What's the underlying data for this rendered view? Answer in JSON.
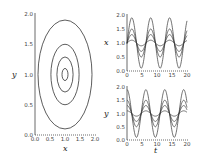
{
  "chart_data": [
    {
      "type": "line",
      "title": "",
      "xlabel": "x",
      "ylabel": "y",
      "xlim": [
        0,
        2
      ],
      "ylim": [
        0,
        2
      ],
      "xticks": [
        "0.0",
        "0.5",
        "1.0",
        "1.5",
        "2.0"
      ],
      "yticks": [
        "0.0",
        "0.5",
        "1.0",
        "1.5",
        "2.0"
      ],
      "grid": false,
      "description": "Phase portrait: closed orbits around center (1,1)",
      "center": [
        1,
        1
      ],
      "series": [
        {
          "name": "orbit-1",
          "x_range": [
            0.9,
            1.1
          ],
          "y_range": [
            0.9,
            1.1
          ]
        },
        {
          "name": "orbit-2",
          "x_range": [
            0.73,
            1.27
          ],
          "y_range": [
            0.71,
            1.29
          ]
        },
        {
          "name": "orbit-3",
          "x_range": [
            0.53,
            1.47
          ],
          "y_range": [
            0.5,
            1.5
          ]
        },
        {
          "name": "orbit-4",
          "x_range": [
            0.1,
            1.9
          ],
          "y_range": [
            0.1,
            1.9
          ]
        }
      ]
    },
    {
      "type": "line",
      "title": "",
      "xlabel": "",
      "ylabel": "x",
      "xlim": [
        0,
        20
      ],
      "ylim": [
        0,
        2
      ],
      "xticks": [
        "0",
        "5",
        "10",
        "15",
        "20"
      ],
      "yticks": [
        "0.0",
        "0.5",
        "1.0",
        "1.5",
        "2.0"
      ],
      "grid": false,
      "period": 6.3,
      "phase_peak_t": 1.6,
      "series": [
        {
          "name": "amp-0.1",
          "amplitude": 0.1
        },
        {
          "name": "amp-0.3",
          "amplitude": 0.3
        },
        {
          "name": "amp-0.5",
          "amplitude": 0.5
        },
        {
          "name": "amp-0.9",
          "amplitude": 0.9
        }
      ]
    },
    {
      "type": "line",
      "title": "",
      "xlabel": "t",
      "ylabel": "y",
      "xlim": [
        0,
        20
      ],
      "ylim": [
        0,
        2
      ],
      "xticks": [
        "0",
        "5",
        "10",
        "15",
        "20"
      ],
      "yticks": [
        "0.0",
        "0.5",
        "1.0",
        "1.5",
        "2.0"
      ],
      "grid": false,
      "period": 6.3,
      "phase_peak_t": 0.0,
      "series": [
        {
          "name": "amp-0.1",
          "amplitude": 0.1
        },
        {
          "name": "amp-0.3",
          "amplitude": 0.3
        },
        {
          "name": "amp-0.5",
          "amplitude": 0.5
        },
        {
          "name": "amp-0.9",
          "amplitude": 0.9
        }
      ]
    }
  ],
  "colors": {
    "line": "#333333",
    "axis": "#444444"
  }
}
